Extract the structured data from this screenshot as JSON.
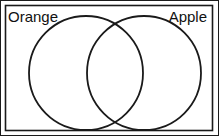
{
  "diagram": {
    "type": "venn",
    "sets": [
      {
        "label": "Orange",
        "cx": 86,
        "cy": 73,
        "r": 57
      },
      {
        "label": "Apple",
        "cx": 144,
        "cy": 73,
        "r": 57
      }
    ],
    "colors": {
      "stroke": "#1a1a1a",
      "background": "#ffffff"
    }
  }
}
